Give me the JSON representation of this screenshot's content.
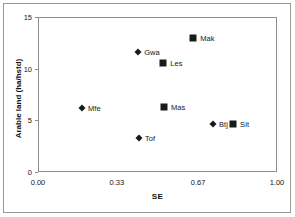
{
  "chart_data": {
    "type": "scatter",
    "title": "",
    "xlabel": "SE",
    "ylabel": "Arable land (ha/hstd)",
    "xlim": [
      0.0,
      1.0
    ],
    "ylim": [
      0,
      15
    ],
    "xticks": [
      "0.00",
      "0.33",
      "0.67",
      "1.00"
    ],
    "xtick_values": [
      0.0,
      0.33,
      0.67,
      1.0
    ],
    "yticks": [
      "0",
      "5",
      "10",
      "15"
    ],
    "ytick_values": [
      0,
      5,
      10,
      15
    ],
    "grid": false,
    "legend": "none",
    "points": [
      {
        "label": "Mak",
        "x": 0.645,
        "y": 13.1,
        "marker": "square"
      },
      {
        "label": "Gwa",
        "x": 0.415,
        "y": 11.7,
        "marker": "diamond"
      },
      {
        "label": "Les",
        "x": 0.52,
        "y": 10.6,
        "marker": "square"
      },
      {
        "label": "Mas",
        "x": 0.523,
        "y": 6.4,
        "marker": "square"
      },
      {
        "label": "Mfe",
        "x": 0.18,
        "y": 6.3,
        "marker": "diamond"
      },
      {
        "label": "Btj",
        "x": 0.728,
        "y": 4.7,
        "marker": "diamond"
      },
      {
        "label": "Sit",
        "x": 0.812,
        "y": 4.7,
        "marker": "square"
      },
      {
        "label": "Tof",
        "x": 0.418,
        "y": 3.4,
        "marker": "diamond"
      }
    ]
  },
  "colors": {
    "marker": "#1a1a1a",
    "axis": "#8d8d8d",
    "frame": "#9a9a9a",
    "text": "#161616",
    "background": "#ffffff"
  }
}
